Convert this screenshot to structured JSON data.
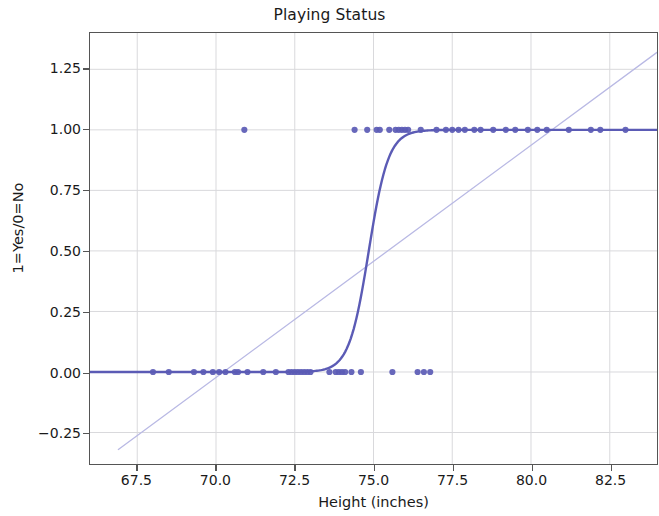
{
  "chart_data": {
    "type": "scatter",
    "title": "Playing Status",
    "xlabel": "Height (inches)",
    "ylabel": "1=Yes/0=No",
    "xlim": [
      66.0,
      84.0
    ],
    "ylim": [
      -0.38,
      1.4
    ],
    "xticks": [
      67.5,
      70.0,
      72.5,
      75.0,
      77.5,
      80.0,
      82.5
    ],
    "xtick_labels": [
      "67.5",
      "70.0",
      "72.5",
      "75.0",
      "77.5",
      "80.0",
      "82.5"
    ],
    "yticks": [
      -0.25,
      0.0,
      0.25,
      0.5,
      0.75,
      1.0,
      1.25
    ],
    "ytick_labels": [
      "−0.25",
      "0.00",
      "0.25",
      "0.50",
      "0.75",
      "1.00",
      "1.25"
    ],
    "grid": true,
    "legend": null,
    "point_color": "#5B5BB5",
    "curve_color": "#5B5BB5",
    "line_color": "#B9B9E4",
    "grid_color": "#D9D9DC",
    "series": [
      {
        "name": "observations",
        "type": "scatter",
        "marker": "circle",
        "marker_size": 5,
        "color": "#5B5BB5",
        "points": [
          [
            68.0,
            0
          ],
          [
            68.5,
            0
          ],
          [
            69.3,
            0
          ],
          [
            69.6,
            0
          ],
          [
            69.9,
            0
          ],
          [
            70.1,
            0
          ],
          [
            70.3,
            0
          ],
          [
            70.6,
            0
          ],
          [
            70.7,
            0
          ],
          [
            71.0,
            0
          ],
          [
            71.5,
            0
          ],
          [
            71.9,
            0
          ],
          [
            72.3,
            0
          ],
          [
            72.4,
            0
          ],
          [
            72.5,
            0
          ],
          [
            72.6,
            0
          ],
          [
            72.7,
            0
          ],
          [
            72.8,
            0
          ],
          [
            72.9,
            0
          ],
          [
            73.0,
            0
          ],
          [
            73.6,
            0
          ],
          [
            73.8,
            0
          ],
          [
            73.9,
            0
          ],
          [
            74.0,
            0
          ],
          [
            74.1,
            0
          ],
          [
            74.3,
            0
          ],
          [
            74.6,
            0
          ],
          [
            75.6,
            0
          ],
          [
            76.4,
            0
          ],
          [
            76.6,
            0
          ],
          [
            76.8,
            0
          ],
          [
            70.9,
            1
          ],
          [
            74.4,
            1
          ],
          [
            74.8,
            1
          ],
          [
            75.1,
            1
          ],
          [
            75.2,
            1
          ],
          [
            75.5,
            1
          ],
          [
            75.7,
            1
          ],
          [
            75.8,
            1
          ],
          [
            75.9,
            1
          ],
          [
            76.0,
            1
          ],
          [
            76.1,
            1
          ],
          [
            76.5,
            1
          ],
          [
            77.0,
            1
          ],
          [
            77.3,
            1
          ],
          [
            77.5,
            1
          ],
          [
            77.7,
            1
          ],
          [
            77.9,
            1
          ],
          [
            78.2,
            1
          ],
          [
            78.4,
            1
          ],
          [
            78.8,
            1
          ],
          [
            79.2,
            1
          ],
          [
            79.5,
            1
          ],
          [
            79.9,
            1
          ],
          [
            80.2,
            1
          ],
          [
            80.5,
            1
          ],
          [
            81.2,
            1
          ],
          [
            81.9,
            1
          ],
          [
            82.2,
            1
          ],
          [
            83.0,
            1
          ]
        ]
      },
      {
        "name": "logistic-fit",
        "type": "line",
        "color": "#5B5BB5",
        "linewidth": 2.4,
        "model": "logistic",
        "midpoint_x": 74.85,
        "steepness": 3.2,
        "asymptotes": [
          0,
          1
        ]
      },
      {
        "name": "linear-fit",
        "type": "line",
        "color": "#B9B9E4",
        "linewidth": 1.3,
        "model": "linear",
        "endpoints": [
          [
            66.9,
            -0.32
          ],
          [
            84.0,
            1.32
          ]
        ]
      }
    ]
  },
  "figure": {
    "title": "Playing Status",
    "x_axis_label": "Height (inches)",
    "y_axis_label": "1=Yes/0=No"
  }
}
